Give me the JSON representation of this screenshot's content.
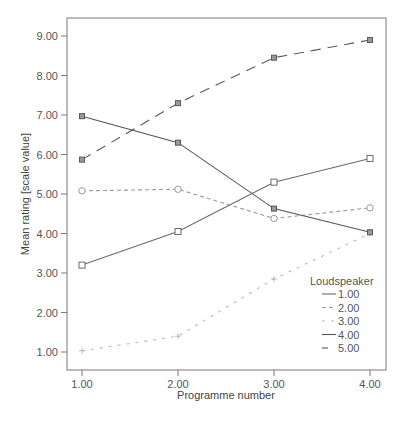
{
  "chart_data": {
    "type": "line",
    "title": "",
    "xlabel": "Programme number",
    "ylabel": "Mean rating [scale value]",
    "x": [
      1.0,
      2.0,
      3.0,
      4.0
    ],
    "x_tick_labels": [
      "1.00",
      "2.00",
      "3.00",
      "4.00"
    ],
    "y_tick_values": [
      1,
      2,
      3,
      4,
      5,
      6,
      7,
      8,
      9
    ],
    "y_tick_labels": [
      "1.00",
      "2.00",
      "3.00",
      "4.00",
      "5.00",
      "6.00",
      "7.00",
      "8.00",
      "9.00"
    ],
    "xlim": [
      0.85,
      4.17
    ],
    "ylim": [
      0.55,
      9.47
    ],
    "grid": false,
    "legend": {
      "title": "Loudspeaker",
      "position": "lower right"
    },
    "series": [
      {
        "name": "1.00",
        "values": [
          3.2,
          4.05,
          5.3,
          5.9
        ],
        "color": "#6a6a6a",
        "dash": "",
        "marker": "square"
      },
      {
        "name": "2.00",
        "values": [
          5.08,
          5.12,
          4.38,
          4.65
        ],
        "color": "#9a9a9a",
        "dash": "4,3",
        "marker": "circle"
      },
      {
        "name": "3.00",
        "values": [
          1.03,
          1.4,
          2.85,
          4.0
        ],
        "color": "#b8b8b8",
        "dash": "3,6",
        "marker": "plus"
      },
      {
        "name": "4.00",
        "values": [
          6.97,
          6.3,
          4.63,
          4.03
        ],
        "color": "#555555",
        "dash": "",
        "marker": "square-filled"
      },
      {
        "name": "5.00",
        "values": [
          5.87,
          7.3,
          8.45,
          8.9
        ],
        "color": "#5a5a5a",
        "dash": "10,7",
        "marker": "square-filled"
      }
    ]
  }
}
